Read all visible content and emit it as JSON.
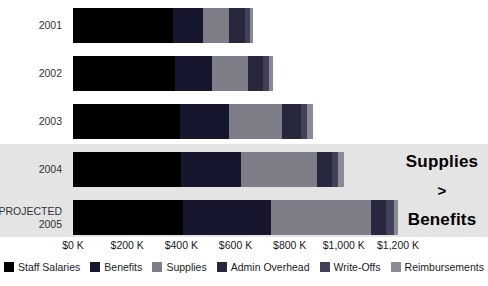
{
  "chart_data": {
    "type": "bar",
    "orientation": "horizontal",
    "stacked": true,
    "categories": [
      "2001",
      "2002",
      "2003",
      "2004",
      "PROJECTED 2005"
    ],
    "series": [
      {
        "name": "Staff Salaries",
        "color": "#000000",
        "values": [
          370,
          375,
          395,
          400,
          405
        ]
      },
      {
        "name": "Benefits",
        "color": "#16162e",
        "values": [
          110,
          140,
          180,
          220,
          325
        ]
      },
      {
        "name": "Supplies",
        "color": "#7e7e89",
        "values": [
          95,
          130,
          195,
          280,
          370
        ]
      },
      {
        "name": "Admin Overhead",
        "color": "#27273e",
        "values": [
          60,
          55,
          70,
          55,
          55
        ]
      },
      {
        "name": "Write-Offs",
        "color": "#41415a",
        "values": [
          20,
          25,
          25,
          25,
          30
        ]
      },
      {
        "name": "Reimbursements",
        "color": "#8a8a94",
        "values": [
          10,
          15,
          20,
          20,
          15
        ]
      }
    ],
    "row_totals_k": [
      665,
      740,
      885,
      1000,
      1200
    ],
    "x_ticks": [
      "$0 K",
      "$200 K",
      "$400 K",
      "$600 K",
      "$800 K",
      "$1,000 K",
      "$1,200 K"
    ],
    "xlim": [
      0,
      1200
    ],
    "x_unit": "$K",
    "grid": false,
    "legend_position": "bottom",
    "highlighted_categories": [
      "2004",
      "PROJECTED 2005"
    ],
    "highlight_color": "#e4e4e4"
  },
  "annotation": {
    "line1": "Supplies",
    "line2": ">",
    "line3": "Benefits"
  }
}
